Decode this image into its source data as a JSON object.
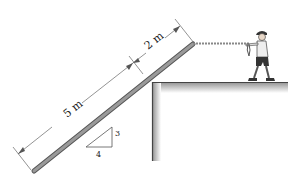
{
  "diagram": {
    "dimensions": {
      "lower_length": "5 m",
      "upper_length": "2 m"
    },
    "slope": {
      "rise": "3",
      "run": "4"
    },
    "colors": {
      "plank": "#8a8a8a",
      "ground_shadow": "#c8c8c8",
      "line": "#555555",
      "rope": "#999999"
    }
  }
}
